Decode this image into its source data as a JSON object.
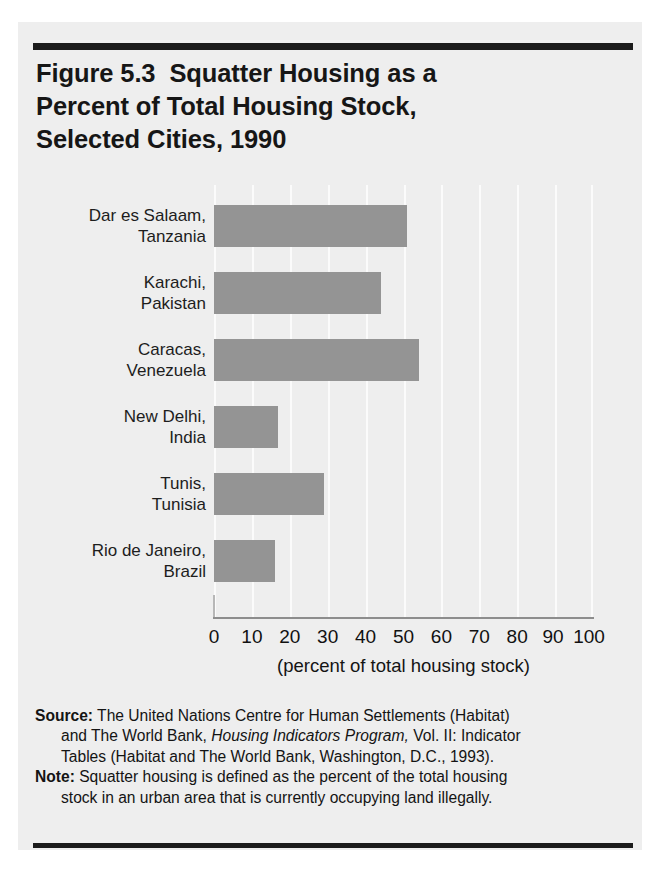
{
  "figure": {
    "title_lines": [
      "Figure 5.3  Squatter Housing as a",
      "Percent of Total Housing Stock,",
      "Selected Cities, 1990"
    ],
    "title_full": "Figure 5.3  Squatter Housing as a Percent of Total Housing Stock, Selected Cities, 1990"
  },
  "chart_data": {
    "type": "bar",
    "orientation": "horizontal",
    "title": "Figure 5.3  Squatter Housing as a Percent of Total Housing Stock, Selected Cities, 1990",
    "categories": [
      "Dar es Salaam, Tanzania",
      "Karachi, Pakistan",
      "Caracas, Venezuela",
      "New Delhi, India",
      "Tunis, Tunisia",
      "Rio de Janeiro, Brazil"
    ],
    "category_lines": [
      [
        "Dar es Salaam,",
        "Tanzania"
      ],
      [
        "Karachi,",
        "Pakistan"
      ],
      [
        "Caracas,",
        "Venezuela"
      ],
      [
        "New Delhi,",
        "India"
      ],
      [
        "Tunis,",
        "Tunisia"
      ],
      [
        "Rio de Janeiro,",
        "Brazil"
      ]
    ],
    "values": [
      51,
      44,
      54,
      17,
      29,
      16
    ],
    "xlabel": "(percent of total housing stock)",
    "ylabel": "",
    "xlim": [
      0,
      100
    ],
    "xticks": [
      0,
      10,
      20,
      30,
      40,
      50,
      60,
      70,
      80,
      90,
      100
    ],
    "xtick_labels": [
      "0",
      "10",
      "20",
      "30",
      "40",
      "50",
      "60",
      "70",
      "80",
      "90",
      "100"
    ],
    "grid": "vertical-only",
    "legend": "none",
    "bar_color": "#949494",
    "gridline_color": "#fbfbfb",
    "plot_background": "#eeeeee"
  },
  "footnotes": {
    "source_label": "Source:",
    "source_text_1": " The United Nations Centre for Human Settlements (Habitat)",
    "source_text_2": "and The World Bank, ",
    "source_italic": "Housing Indicators Program,",
    "source_text_3": " Vol. II: Indicator",
    "source_text_4": "Tables (Habitat and The World Bank, Washington, D.C., 1993).",
    "note_label": "Note:",
    "note_text_1": " Squatter housing is defined as the percent of the total housing",
    "note_text_2": "stock in an urban area that is currently occupying land illegally."
  }
}
